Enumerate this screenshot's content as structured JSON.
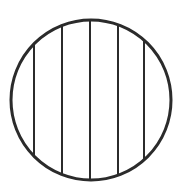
{
  "diagram": {
    "shape": "circle-divided-by-vertical-chords",
    "stroke_color": "#2b2b2b",
    "background": "#ffffff",
    "circle": {
      "cx": 91,
      "cy": 100,
      "r": 80,
      "stroke_width": 3
    },
    "chords": [
      {
        "x": 34,
        "stroke_width": 2
      },
      {
        "x": 62,
        "stroke_width": 2
      },
      {
        "x": 90,
        "stroke_width": 2
      },
      {
        "x": 118,
        "stroke_width": 2
      },
      {
        "x": 144,
        "stroke_width": 2
      }
    ]
  }
}
